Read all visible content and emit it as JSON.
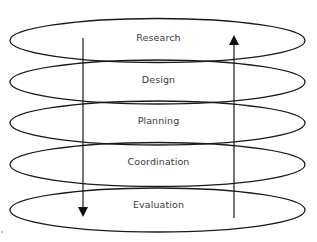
{
  "diagram": {
    "title": "",
    "layers": [
      {
        "label": "Research",
        "center_y": 41
      },
      {
        "label": "Design",
        "center_y": 82
      },
      {
        "label": "Planning",
        "center_y": 123
      },
      {
        "label": "Coordination",
        "center_y": 164
      },
      {
        "label": "Evaluation",
        "center_y": 206
      }
    ],
    "arrows": [
      {
        "name": "down-arrow",
        "direction": "down",
        "x": 83,
        "from": "Research",
        "to": "Evaluation"
      },
      {
        "name": "up-arrow",
        "direction": "up",
        "x": 234,
        "from": "Evaluation",
        "to": "Research"
      }
    ],
    "colors": {
      "stroke": "#1a1a1a",
      "text": "#3a3a3a",
      "background": "#ffffff"
    }
  }
}
